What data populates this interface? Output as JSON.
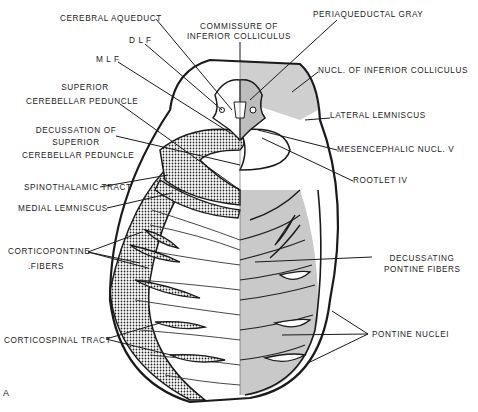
{
  "figure": {
    "panel_letter": "A",
    "colors": {
      "outline": "#1a1a1a",
      "gray_shading": "#c9c9c9",
      "stipple": "#2a2a2a",
      "background": "#ffffff"
    }
  },
  "labels": {
    "cerebral_aqueduct": "CEREBRAL AQUEDUCT",
    "commissure_line1": "COMMISSURE OF",
    "commissure_line2": "INFERIOR COLLICULUS",
    "periaqueductal_gray": "PERIAQUEDUCTAL GRAY",
    "dlf": "D L F",
    "mlf": "M L F",
    "nucl_inferior_colliculus": "NUCL. OF INFERIOR COLLICULUS",
    "superior_cp_line1": "SUPERIOR",
    "superior_cp_line2": "CEREBELLAR PEDUNCLE",
    "lateral_lemniscus": "LATERAL LEMNISCUS",
    "decussation_line1": "DECUSSATION OF",
    "decussation_line2": "SUPERIOR",
    "decussation_line3": "CEREBELLAR PEDUNCLE",
    "mesencephalic_nucl": "MESENCEPHALIC NUCL. V",
    "rootlet": "ROOTLET IV",
    "spinothalamic": "SPINOTHALAMIC TRACT",
    "medial_lemniscus": "MEDIAL LEMNISCUS",
    "corticopontine_line1": "CORTICOPONTINE",
    "corticopontine_line2": ".FIBERS",
    "decussating_line1": "DECUSSATING",
    "decussating_line2": "PONTINE FIBERS",
    "corticospinal": "CORTICOSPINAL TRACT",
    "pontine_nuclei": "PONTINE NUCLEI"
  }
}
